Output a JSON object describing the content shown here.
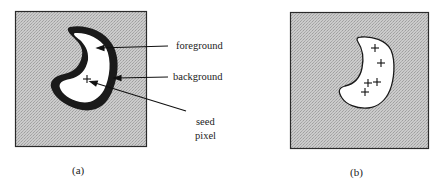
{
  "figure": {
    "panels": [
      {
        "id": "a",
        "caption": "(a)",
        "annotations": [
          {
            "label": "foreground",
            "target": "white-interior-region"
          },
          {
            "label": "background",
            "target": "dark-boundary-band"
          },
          {
            "label_line1": "seed",
            "label_line2": "pixel",
            "target": "plus-marker-inside-region"
          }
        ],
        "seed_markers": 1
      },
      {
        "id": "b",
        "caption": "(b)",
        "seed_markers": 5
      }
    ],
    "colors": {
      "texture_gray": "#c8c8c8",
      "texture_dot": "#a8a8a8",
      "boundary": "#1a1a1a",
      "region_fill": "#ffffff",
      "frame": "#2a2a2a",
      "text": "#222222"
    },
    "icons": {
      "seed_marker": "plus-icon"
    }
  }
}
